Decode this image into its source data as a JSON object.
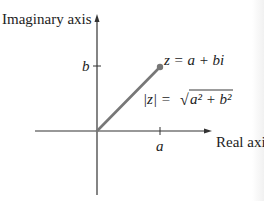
{
  "diagram": {
    "labels": {
      "imaginary_axis": "Imaginary axis",
      "real_axis": "Real axis",
      "b_tick": "b",
      "a_tick": "a",
      "z_equation": "z = a + bi",
      "modulus_lhs": "|z| = ",
      "sqrt_sign": "√",
      "modulus_radicand": "a² + b²"
    },
    "geometry": {
      "origin": [
        97,
        131
      ],
      "point": [
        160,
        67
      ],
      "line_color": "#777777",
      "axis_color": "#333333"
    }
  }
}
